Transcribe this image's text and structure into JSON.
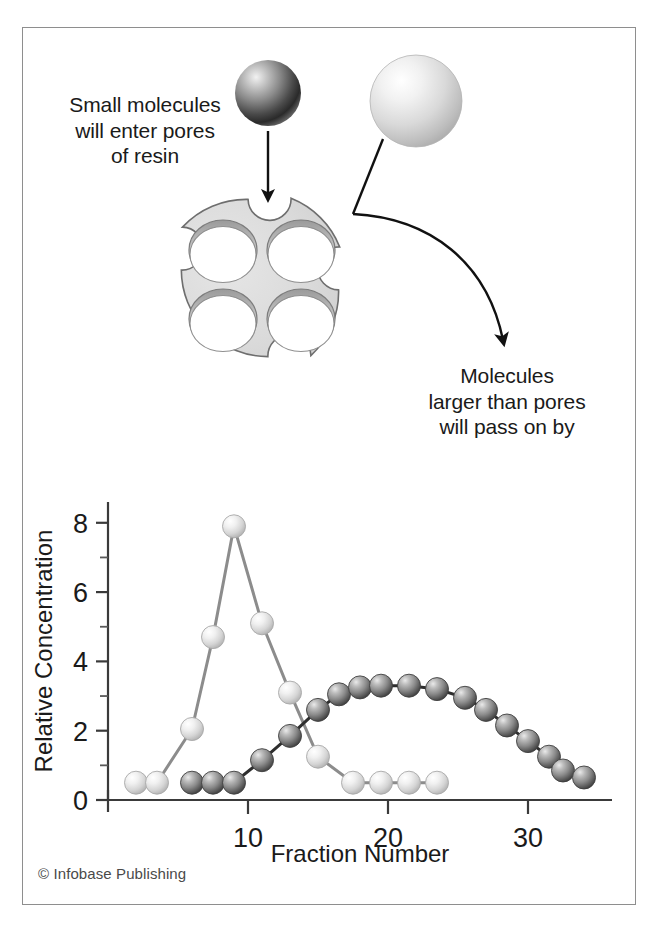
{
  "figure": {
    "annotations": {
      "small_molecules": "Small molecules\nwill enter pores\nof resin",
      "large_molecules": "Molecules\nlarger than pores\nwill pass on by"
    },
    "copyright": "© Infobase Publishing",
    "diagram": {
      "resin_bead_label": "resin-bead",
      "pore_count": 4,
      "notch_count": 4,
      "small_molecule_color": "#6b6b6b",
      "large_molecule_color": "#d8d8d8",
      "bead_fill": "#d9d9d9",
      "bead_stroke": "#6e6e6e"
    }
  },
  "chart_data": {
    "type": "line",
    "title": "",
    "xlabel": "Fraction Number",
    "ylabel": "Relative Concentration",
    "xlim": [
      0,
      36
    ],
    "ylim": [
      0,
      8.6
    ],
    "xticks": [
      10,
      20,
      30
    ],
    "yticks": [
      0,
      2,
      4,
      6,
      8
    ],
    "xtick_labels": [
      "10",
      "20",
      "30"
    ],
    "ytick_labels": [
      "0",
      "2",
      "4",
      "6",
      "8"
    ],
    "minor_yticks": [
      1,
      3,
      5,
      7
    ],
    "grid": false,
    "legend": "none",
    "series": [
      {
        "name": "small-molecules-light",
        "marker_color": "#e2e2e2",
        "line_color": "#8c8c8c",
        "x": [
          2,
          3.5,
          6,
          7.5,
          9,
          11,
          13,
          15,
          17.5,
          19.5,
          21.5,
          23.5
        ],
        "values": [
          0.5,
          0.5,
          2.05,
          4.7,
          7.9,
          5.1,
          3.1,
          1.25,
          0.5,
          0.5,
          0.5,
          0.5
        ]
      },
      {
        "name": "large-molecules-dark",
        "marker_color": "#7a7a7a",
        "line_color": "#2e2e2e",
        "x": [
          6,
          7.5,
          9,
          11,
          13,
          15,
          16.5,
          18,
          19.5,
          21.5,
          23.5,
          25.5,
          27,
          28.5,
          30,
          31.5,
          32.5,
          34
        ],
        "values": [
          0.5,
          0.5,
          0.5,
          1.15,
          1.85,
          2.6,
          3.05,
          3.25,
          3.3,
          3.3,
          3.2,
          2.95,
          2.6,
          2.15,
          1.7,
          1.25,
          0.85,
          0.65
        ]
      }
    ]
  }
}
